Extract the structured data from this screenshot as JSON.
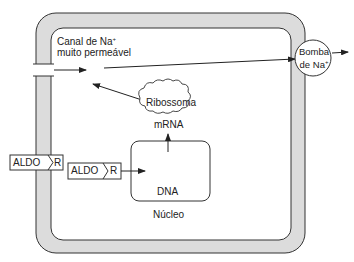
{
  "diagram": {
    "type": "cell-schematic",
    "labels": {
      "channel_line1": "Canal de  Na",
      "channel_sup": "+",
      "channel_line2": "muito permeável",
      "pump_line1": "Bomba",
      "pump_line2": "de Na",
      "pump_sup": "+",
      "ribosome": "Ribossoma",
      "mrna": "mRNA",
      "dna": "DNA",
      "nucleus": "Núcleo",
      "aldo_outer_ligand": "ALDO",
      "aldo_outer_receptor": "R",
      "aldo_inner_ligand": "ALDO",
      "aldo_inner_receptor": "R"
    },
    "colors": {
      "membrane_fill": "#dcdcdc",
      "stroke": "#333333",
      "background": "#ffffff"
    }
  }
}
